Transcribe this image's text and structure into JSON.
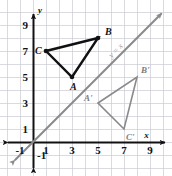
{
  "figure": {
    "colors": {
      "grid": "#c9ccd4",
      "axis": "#111111",
      "preimage": "#111111",
      "image": "#8a8a8a",
      "mirror_line": "#8a8a8a",
      "background": "#ffffff"
    },
    "grid": {
      "spacing_px": 13,
      "origin_px": {
        "x": 33,
        "y": 142
      },
      "x_range": [
        -2,
        10
      ],
      "y_range": [
        -2,
        11
      ],
      "visible": true
    },
    "axes": {
      "x_axis_label": "x",
      "y_axis_label": "y",
      "x_ticks": [
        {
          "value": -1,
          "label": "-1"
        },
        {
          "value": 1,
          "label": "1"
        },
        {
          "value": 3,
          "label": "3"
        },
        {
          "value": 5,
          "label": "5"
        },
        {
          "value": 7,
          "label": "7"
        },
        {
          "value": 9,
          "label": "9"
        }
      ],
      "y_ticks": [
        {
          "value": 9,
          "label": "9"
        },
        {
          "value": 7,
          "label": "7"
        },
        {
          "value": 5,
          "label": "5"
        },
        {
          "value": 3,
          "label": "3"
        },
        {
          "value": 1,
          "label": "1"
        },
        {
          "value": -1,
          "label": "-1"
        }
      ]
    },
    "mirror_line": {
      "label": "y = x",
      "equation": "y = x",
      "slope": 1,
      "intercept": 0,
      "arrows": "both"
    },
    "shapes": [
      {
        "name": "triangle-abc",
        "kind": "preimage",
        "vertices": [
          {
            "label": "A",
            "x": 3,
            "y": 5,
            "label_dx": -2,
            "label_dy": 13
          },
          {
            "label": "B",
            "x": 5,
            "y": 8,
            "label_dx": 7,
            "label_dy": -3
          },
          {
            "label": "C",
            "x": 1,
            "y": 7,
            "label_dx": -11,
            "label_dy": 3
          }
        ],
        "has_vertex_dots": true
      },
      {
        "name": "triangle-a-prime-b-prime-c-prime",
        "kind": "image",
        "vertices": [
          {
            "label": "A'",
            "x": 5,
            "y": 3,
            "label_dx": -14,
            "label_dy": -2
          },
          {
            "label": "B'",
            "x": 8,
            "y": 5,
            "label_dx": 4,
            "label_dy": -4
          },
          {
            "label": "C'",
            "x": 7,
            "y": 1,
            "label_dx": 2,
            "label_dy": 11
          }
        ],
        "has_vertex_dots": false
      }
    ]
  }
}
